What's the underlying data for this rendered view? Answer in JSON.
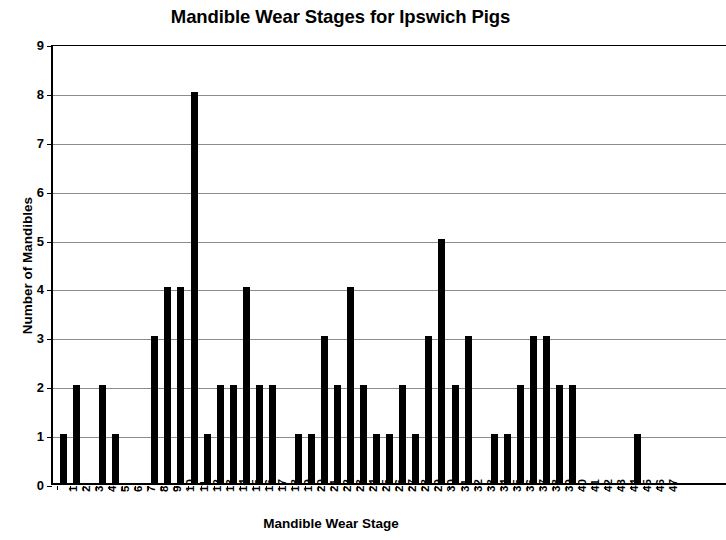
{
  "chart_data": {
    "type": "bar",
    "title": "Mandible Wear Stages for Ipswich Pigs",
    "xlabel": "Mandible Wear Stage",
    "ylabel": "Number of Mandibles",
    "ylim": [
      0,
      9
    ],
    "ytick_labels": [
      "0",
      "1",
      "2",
      "3",
      "4",
      "5",
      "6",
      "7",
      "8",
      "9"
    ],
    "yticks": [
      0,
      1,
      2,
      3,
      4,
      5,
      6,
      7,
      8,
      9
    ],
    "grid": true,
    "grid_axis": "y",
    "legend": null,
    "bar_color": "#000000",
    "categories": [
      "1",
      "2",
      "3",
      "4",
      "5",
      "6",
      "7",
      "8",
      "9",
      "10",
      "11",
      "12",
      "13",
      "14",
      "15",
      "16",
      "17",
      "18",
      "19",
      "20",
      "21",
      "22",
      "23",
      "24",
      "25",
      "26",
      "27",
      "28",
      "29",
      "30",
      "31",
      "32",
      "33",
      "34",
      "35",
      "36",
      "37",
      "38",
      "39",
      "40",
      "41",
      "42",
      "43",
      "44",
      "45",
      "46",
      "47"
    ],
    "values": [
      1,
      2,
      0,
      2,
      1,
      0,
      0,
      3,
      4,
      4,
      8,
      1,
      2,
      2,
      4,
      2,
      2,
      0,
      1,
      1,
      3,
      2,
      4,
      2,
      1,
      1,
      2,
      1,
      3,
      5,
      2,
      3,
      0,
      1,
      1,
      2,
      3,
      3,
      2,
      2,
      0,
      0,
      0,
      0,
      1,
      0,
      0
    ]
  }
}
